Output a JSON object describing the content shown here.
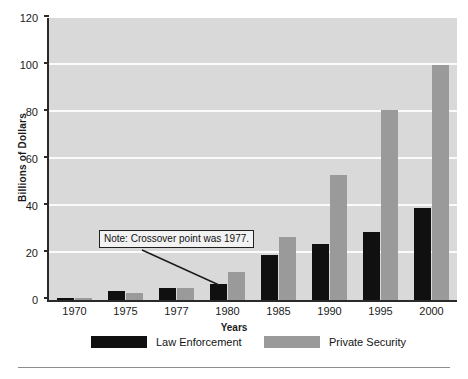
{
  "chart_data": {
    "type": "bar",
    "title": "",
    "subtitle": "",
    "xlabel": "Years",
    "ylabel": "Billions of Dollars",
    "categories": [
      "1970",
      "1975",
      "1977",
      "1980",
      "1985",
      "1990",
      "1995",
      "2000"
    ],
    "series": [
      {
        "name": "Law Enforcement",
        "color": "#101010",
        "values": [
          1,
          4,
          5,
          7,
          19,
          24,
          29,
          39
        ]
      },
      {
        "name": "Private Security",
        "color": "#9a9a9a",
        "values": [
          0.5,
          3,
          5,
          12,
          27,
          53,
          81,
          100
        ]
      }
    ],
    "ylim": [
      0,
      120
    ],
    "yticks": [
      0,
      20,
      40,
      60,
      80,
      100,
      120
    ],
    "ytick_labels": [
      "0",
      "20",
      "40",
      "60",
      "80",
      "100",
      "120"
    ],
    "grid": true,
    "grid_color": "#fbfbfb",
    "plot_background": "#d9d9d9",
    "legend_position": "bottom",
    "annotations": [
      {
        "text": "Note: Crossover point was 1977.",
        "points_to_category": "1977",
        "points_to_series": "Private Security"
      }
    ]
  },
  "legend": {
    "items": [
      {
        "label": "Law Enforcement",
        "color": "#101010"
      },
      {
        "label": "Private Security",
        "color": "#9a9a9a"
      }
    ]
  },
  "annotation": {
    "text": "Note: Crossover point was 1977."
  },
  "axes": {
    "ylabel": "Billions of Dollars",
    "xlabel": "Years"
  }
}
